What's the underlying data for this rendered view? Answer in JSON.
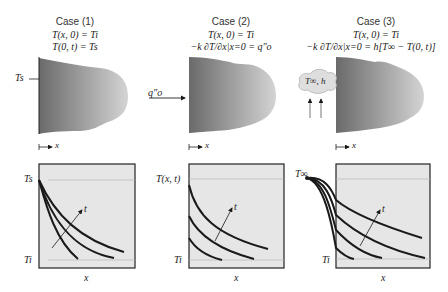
{
  "figure": {
    "cases": [
      {
        "title": "Case (1)",
        "condition_initial": "T(x, 0) = Ti",
        "condition_boundary": "T(0, t) = Ts",
        "surface_label": "Ts",
        "axis_label": "x",
        "plot": {
          "y_top_label": "Ts",
          "y_bottom_label": "Ti",
          "x_label": "x",
          "time_arrow_label": "t"
        }
      },
      {
        "title": "Case (2)",
        "condition_initial": "T(x, 0) = Ti",
        "condition_boundary": "−k ∂T/∂x|x=0 = q″o",
        "surface_label": "q″o",
        "axis_label": "x",
        "plot": {
          "y_top_label": "T(x, t)",
          "y_bottom_label": "Ti",
          "x_label": "x",
          "time_arrow_label": "t"
        }
      },
      {
        "title": "Case (3)",
        "condition_initial": "T(x, 0) = Ti",
        "condition_boundary": "−k ∂T/∂x|x=0 = h[T∞ − T(0, t)]",
        "surface_label": "T∞, h",
        "axis_label": "x",
        "plot": {
          "y_top_label": "T∞",
          "y_bottom_label": "Ti",
          "x_label": "x",
          "time_arrow_label": "t"
        }
      }
    ],
    "colors": {
      "plot_bg": "#e6e6e6",
      "curve": "#1a1a1a",
      "gridline": "#b5b5b5",
      "slab_dark": "#6e6e6e",
      "slab_light": "#d0d0d0"
    }
  }
}
